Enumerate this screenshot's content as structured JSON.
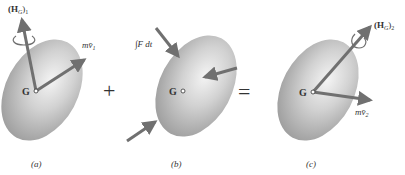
{
  "panels": [
    {
      "caption": "(a)",
      "center_label": "G",
      "momentum_angular": {
        "main": "(H",
        "sub1": "G",
        "close": ")",
        "sub2": "1"
      },
      "momentum_linear": {
        "main": "mv̄",
        "sub": "1"
      }
    },
    {
      "caption": "(b)",
      "center_label": "G",
      "impulse_label": "∫F dt"
    },
    {
      "caption": "(c)",
      "center_label": "G",
      "momentum_angular": {
        "main": "(H",
        "sub1": "G",
        "close": ")",
        "sub2": "2"
      },
      "momentum_linear": {
        "main": "mv̄",
        "sub": "2"
      }
    }
  ],
  "operators": {
    "plus": "+",
    "equals": "="
  },
  "colors": {
    "arrow": "#707070",
    "body_dark": "#a8a8a8",
    "body_light": "#f2f2f2",
    "text": "#333333"
  }
}
